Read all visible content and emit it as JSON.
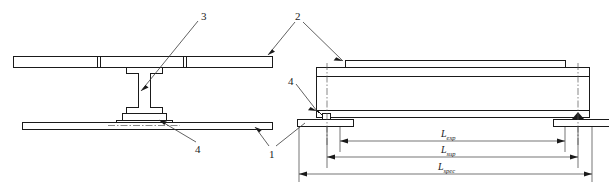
{
  "drawing": {
    "title": "Composite beam specimen - cross-section and elevation",
    "line_color": "#1a1a1a",
    "background": "#ffffff"
  },
  "callouts": [
    {
      "id": "callout-1",
      "label": "1",
      "meaning": "bottom-slab"
    },
    {
      "id": "callout-2",
      "label": "2",
      "meaning": "top-slab"
    },
    {
      "id": "callout-3",
      "label": "3",
      "meaning": "steel-i-beam"
    },
    {
      "id": "callout-4-left",
      "label": "4",
      "meaning": "shear-connector"
    },
    {
      "id": "callout-4-right",
      "label": "4",
      "meaning": "support-bearing"
    }
  ],
  "dimensions": [
    {
      "id": "dim-exp",
      "symbol": "L",
      "subscript": "exp"
    },
    {
      "id": "dim-sup",
      "symbol": "L",
      "subscript": "sup"
    },
    {
      "id": "dim-spec",
      "symbol": "L",
      "subscript": "spec"
    }
  ],
  "views": {
    "section": {
      "name": "cross-section-view"
    },
    "elevation": {
      "name": "elevation-view"
    }
  }
}
